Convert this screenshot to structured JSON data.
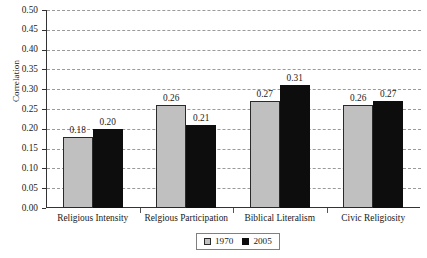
{
  "chart_data": {
    "type": "bar",
    "title": "",
    "xlabel": "",
    "ylabel": "Correlation",
    "ylim": [
      0.0,
      0.5
    ],
    "ytick_step": 0.05,
    "grid": true,
    "legend_position": "bottom-center",
    "categories": [
      "Religious Intensity",
      "Relgious Participation",
      "Biblical Literalism",
      "Civic Religiosity"
    ],
    "series": [
      {
        "name": "1970",
        "color": "#c0c0c0",
        "values": [
          0.18,
          0.26,
          0.27,
          0.26
        ]
      },
      {
        "name": "2005",
        "color": "#0d0d0d",
        "values": [
          0.2,
          0.21,
          0.31,
          0.27
        ]
      }
    ],
    "value_labels": {
      "1970": [
        "0.18",
        "0.26",
        "0.27",
        "0.26"
      ],
      "2005": [
        "0.20",
        "0.21",
        "0.31",
        "0.27"
      ]
    },
    "ytick_labels": [
      "0.50",
      "0.45",
      "0.40",
      "0.35",
      "0.30",
      "0.25",
      "0.20",
      "0.15",
      "0.10",
      "0.05",
      "0.00"
    ]
  },
  "legend": {
    "items": [
      {
        "label": "1970",
        "swatch": "s1970"
      },
      {
        "label": "2005",
        "swatch": "s2005"
      }
    ]
  }
}
